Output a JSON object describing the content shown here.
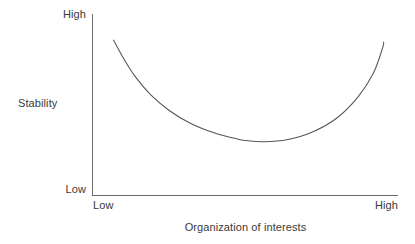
{
  "figure": {
    "background_color": "#ffffff",
    "line_color": "#555555",
    "axis_color": "#666666",
    "text_color": "#3a3a3a"
  },
  "axes": {
    "y": {
      "title": "Stability",
      "low_label": "Low",
      "high_label": "High"
    },
    "x": {
      "title": "Organization of interests",
      "low_label": "Low",
      "high_label": "High"
    }
  },
  "chart_data": {
    "type": "line",
    "title": "",
    "subtitle": "",
    "xlabel": "Organization of interests",
    "ylabel": "Stability",
    "xlim": [
      0,
      1
    ],
    "ylim": [
      0,
      1
    ],
    "xtick_labels": [
      "Low",
      "High"
    ],
    "ytick_labels": [
      "Low",
      "High"
    ],
    "grid": false,
    "legend": null,
    "annotations": [],
    "series": [
      {
        "name": "Stability curve",
        "shape": "u-shaped",
        "color": "#555555",
        "x": [
          0.069,
          0.1,
          0.14,
          0.19,
          0.25,
          0.32,
          0.4,
          0.48,
          0.5,
          0.56,
          0.64,
          0.72,
          0.8,
          0.87,
          0.92,
          0.95,
          0.953
        ],
        "y": [
          0.856,
          0.76,
          0.655,
          0.556,
          0.47,
          0.398,
          0.344,
          0.309,
          0.303,
          0.296,
          0.309,
          0.35,
          0.427,
          0.545,
          0.676,
          0.815,
          0.845
        ]
      }
    ]
  }
}
